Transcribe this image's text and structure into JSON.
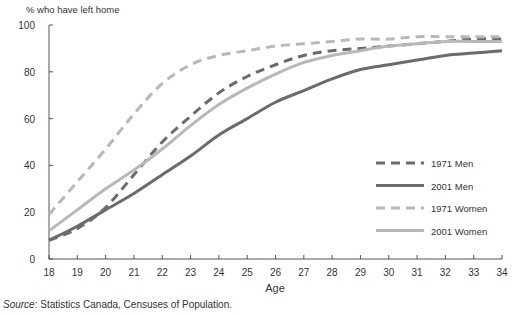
{
  "chart_data": {
    "type": "line",
    "title": "",
    "ylabel": "% who have left home",
    "xlabel": "Age",
    "ylim": [
      0,
      100
    ],
    "xlim": [
      18,
      34
    ],
    "y_ticks": [
      0,
      20,
      40,
      60,
      80,
      100
    ],
    "x": [
      18,
      19,
      20,
      21,
      22,
      23,
      24,
      25,
      26,
      27,
      28,
      29,
      30,
      31,
      32,
      33,
      34
    ],
    "grid": false,
    "legend_position": "right-middle",
    "series": [
      {
        "name": "1971 Men",
        "style": "dashed",
        "color": "#6b6b6b",
        "width": 3,
        "values": [
          8,
          13,
          22,
          36,
          50,
          61,
          71,
          78,
          83,
          87,
          89,
          90,
          91,
          92,
          93,
          94,
          94
        ]
      },
      {
        "name": "2001 Men",
        "style": "solid",
        "color": "#6b6b6b",
        "width": 3,
        "values": [
          8,
          14,
          21,
          28,
          36,
          44,
          53,
          60,
          67,
          72,
          77,
          81,
          83,
          85,
          87,
          88,
          89
        ]
      },
      {
        "name": "1971 Women",
        "style": "dashed",
        "color": "#b8b8b8",
        "width": 3,
        "values": [
          19,
          33,
          47,
          62,
          75,
          83,
          87,
          89,
          91,
          92,
          93,
          94,
          94,
          95,
          95,
          95,
          95
        ]
      },
      {
        "name": "2001 Women",
        "style": "solid",
        "color": "#b8b8b8",
        "width": 3,
        "values": [
          12,
          21,
          30,
          38,
          47,
          57,
          66,
          73,
          79,
          84,
          87,
          89,
          91,
          92,
          93,
          93,
          93
        ]
      }
    ]
  },
  "source": {
    "label": "Source",
    "text": ": Statistics Canada, Censuses of Population."
  }
}
